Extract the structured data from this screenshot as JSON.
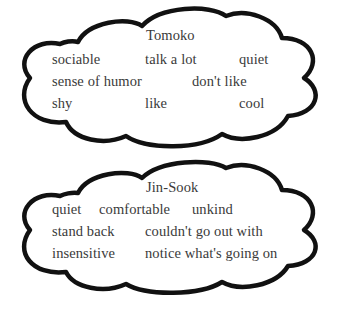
{
  "colors": {
    "outline": "#111111",
    "text": "#3a3a3a",
    "background": "#ffffff"
  },
  "clouds": [
    {
      "title": "Tomoko",
      "words": [
        "sociable",
        "talk a lot",
        "quiet",
        "sense of humor",
        "don't like",
        "shy",
        "like",
        "cool"
      ]
    },
    {
      "title": "Jin-Sook",
      "words": [
        "quiet",
        "comfortable",
        "unkind",
        "stand back",
        "couldn't go out with",
        "insensitive",
        "notice what's going on"
      ]
    }
  ]
}
